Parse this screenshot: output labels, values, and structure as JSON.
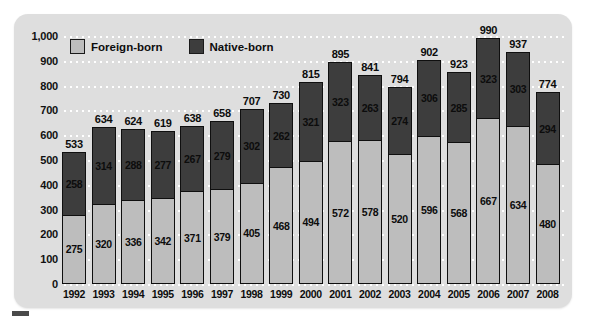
{
  "chart_data": {
    "type": "bar",
    "subtype": "stacked-bar",
    "title": "",
    "subtitle": "",
    "xlabel": "",
    "ylabel": "",
    "categories": [
      "1992",
      "1993",
      "1994",
      "1995",
      "1996",
      "1997",
      "1998",
      "1999",
      "2000",
      "2001",
      "2002",
      "2003",
      "2004",
      "2005",
      "2006",
      "2007",
      "2008"
    ],
    "series": [
      {
        "name": "Foreign-born",
        "color": "#bdbdbd",
        "values": [
          275,
          320,
          336,
          342,
          371,
          379,
          405,
          468,
          494,
          572,
          578,
          520,
          596,
          568,
          667,
          634,
          480
        ]
      },
      {
        "name": "Native-born",
        "color": "#3d3d3d",
        "values": [
          258,
          314,
          288,
          277,
          267,
          279,
          302,
          262,
          321,
          323,
          263,
          274,
          306,
          285,
          323,
          303,
          294
        ]
      }
    ],
    "totals": [
      533,
      634,
      624,
      619,
      638,
      658,
      707,
      730,
      815,
      895,
      841,
      794,
      902,
      923,
      990,
      937,
      774
    ],
    "yticks": [
      "0",
      "100",
      "200",
      "300",
      "400",
      "500",
      "600",
      "700",
      "800",
      "900",
      "1,000"
    ],
    "ytick_values": [
      0,
      100,
      200,
      300,
      400,
      500,
      600,
      700,
      800,
      900,
      1000
    ],
    "ylim": [
      0,
      1000
    ],
    "grid": true,
    "grid_style": "dotted-white-horizontal",
    "legend_position": "top-left-inside",
    "stack_order_bottom_to_top": [
      "Foreign-born",
      "Native-born"
    ]
  },
  "legend": {
    "items": [
      {
        "label": "Foreign-born",
        "swatch": "foreign-born-swatch",
        "color": "#bdbdbd"
      },
      {
        "label": "Native-born",
        "swatch": "native-born-swatch",
        "color": "#3d3d3d"
      }
    ]
  },
  "colors": {
    "panel_background": "#dedede",
    "page_background": "#ffffff",
    "foreign_born": "#bdbdbd",
    "native_born": "#3d3d3d",
    "bar_outline": "#0f0f0f",
    "gridline": "#ffffff",
    "text": "#0d0d0d"
  }
}
